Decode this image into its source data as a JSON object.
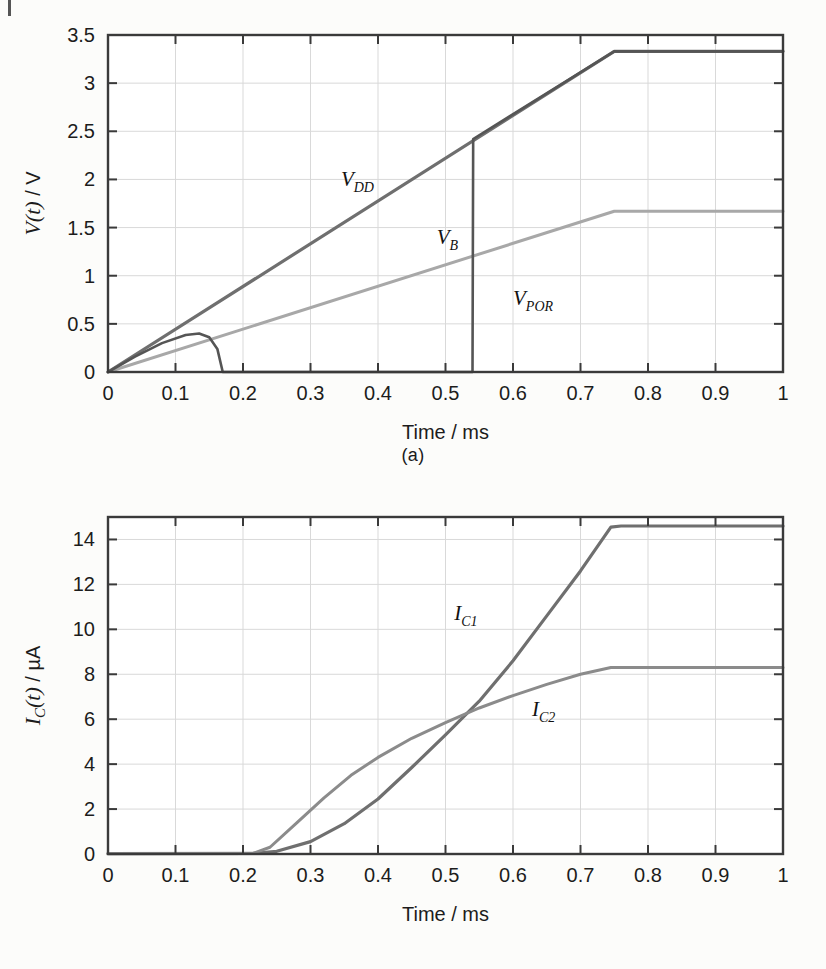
{
  "page": {
    "background_color": "#fcfcfa",
    "corner_mark": true
  },
  "chart_data": [
    {
      "id": "a",
      "type": "line",
      "caption": "(a)",
      "title": "",
      "xlabel": "Time / ms",
      "ylabel": "V(t) / V",
      "xlim": [
        0,
        1
      ],
      "ylim": [
        0,
        3.5
      ],
      "xticks": [
        0,
        0.1,
        0.2,
        0.3,
        0.4,
        0.5,
        0.6,
        0.7,
        0.8,
        0.9,
        1
      ],
      "xticklabels": [
        "0",
        "0.1",
        "0.2",
        "0.3",
        "0.4",
        "0.5",
        "0.6",
        "0.7",
        "0.8",
        "0.9",
        "1"
      ],
      "yticks": [
        0,
        0.5,
        1,
        1.5,
        2,
        2.5,
        3,
        3.5
      ],
      "yticklabels": [
        "0",
        "0.5",
        "1",
        "1.5",
        "2",
        "2.5",
        "3",
        "3.5"
      ],
      "grid": true,
      "legend": "inline-annotations",
      "series": [
        {
          "name": "V_DD",
          "label_text": "V",
          "label_sub": "DD",
          "label_x": 0.345,
          "label_y": 1.93,
          "color": "#6f6f6f",
          "width": 3.2,
          "points": [
            [
              0,
              0
            ],
            [
              0.75,
              3.33
            ],
            [
              1.0,
              3.33
            ]
          ]
        },
        {
          "name": "V_B",
          "label_text": "V",
          "label_sub": "B",
          "label_x": 0.487,
          "label_y": 1.33,
          "color": "#a8a8a8",
          "width": 3.0,
          "points": [
            [
              0,
              0
            ],
            [
              0.75,
              1.67
            ],
            [
              1.0,
              1.67
            ]
          ]
        },
        {
          "name": "V_POR",
          "label_text": "V",
          "label_sub": "POR",
          "label_x": 0.6,
          "label_y": 0.7,
          "color": "#555555",
          "width": 2.6,
          "points": [
            [
              0,
              0
            ],
            [
              0.04,
              0.16
            ],
            [
              0.08,
              0.3
            ],
            [
              0.115,
              0.385
            ],
            [
              0.135,
              0.4
            ],
            [
              0.15,
              0.36
            ],
            [
              0.162,
              0.24
            ],
            [
              0.168,
              0.06
            ],
            [
              0.17,
              0
            ],
            [
              0.54,
              0
            ],
            [
              0.541,
              2.42
            ],
            [
              0.75,
              3.33
            ],
            [
              1.0,
              3.33
            ]
          ]
        }
      ]
    },
    {
      "id": "b",
      "type": "line",
      "caption": "(b)",
      "title": "",
      "xlabel": "Time / ms",
      "ylabel": "I_C(t) / µA",
      "xlim": [
        0,
        1
      ],
      "ylim": [
        0,
        15
      ],
      "xticks": [
        0,
        0.1,
        0.2,
        0.3,
        0.4,
        0.5,
        0.6,
        0.7,
        0.8,
        0.9,
        1
      ],
      "xticklabels": [
        "0",
        "0.1",
        "0.2",
        "0.3",
        "0.4",
        "0.5",
        "0.6",
        "0.7",
        "0.8",
        "0.9",
        "1"
      ],
      "yticks": [
        0,
        2,
        4,
        6,
        8,
        10,
        12,
        14
      ],
      "yticklabels": [
        "0",
        "2",
        "4",
        "6",
        "8",
        "10",
        "12",
        "14"
      ],
      "grid": true,
      "legend": "inline-annotations",
      "series": [
        {
          "name": "I_C1",
          "label_text": "I",
          "label_sub": "C1",
          "label_x": 0.513,
          "label_y": 10.4,
          "color": "#6f6f6f",
          "width": 3.2,
          "points": [
            [
              0,
              0.02
            ],
            [
              0.215,
              0.03
            ],
            [
              0.25,
              0.12
            ],
            [
              0.3,
              0.55
            ],
            [
              0.35,
              1.35
            ],
            [
              0.4,
              2.45
            ],
            [
              0.45,
              3.85
            ],
            [
              0.5,
              5.3
            ],
            [
              0.55,
              6.8
            ],
            [
              0.6,
              8.6
            ],
            [
              0.65,
              10.6
            ],
            [
              0.7,
              12.6
            ],
            [
              0.745,
              14.55
            ],
            [
              0.76,
              14.6
            ],
            [
              1.0,
              14.6
            ]
          ]
        },
        {
          "name": "I_C2",
          "label_text": "I",
          "label_sub": "C2",
          "label_x": 0.628,
          "label_y": 6.15,
          "color": "#8b8b8b",
          "width": 3.0,
          "points": [
            [
              0,
              0.02
            ],
            [
              0.215,
              0.03
            ],
            [
              0.24,
              0.3
            ],
            [
              0.28,
              1.4
            ],
            [
              0.32,
              2.5
            ],
            [
              0.36,
              3.5
            ],
            [
              0.4,
              4.3
            ],
            [
              0.45,
              5.15
            ],
            [
              0.5,
              5.85
            ],
            [
              0.55,
              6.5
            ],
            [
              0.6,
              7.05
            ],
            [
              0.65,
              7.55
            ],
            [
              0.7,
              8.0
            ],
            [
              0.745,
              8.3
            ],
            [
              0.78,
              8.3
            ],
            [
              1.0,
              8.3
            ]
          ]
        }
      ]
    }
  ]
}
